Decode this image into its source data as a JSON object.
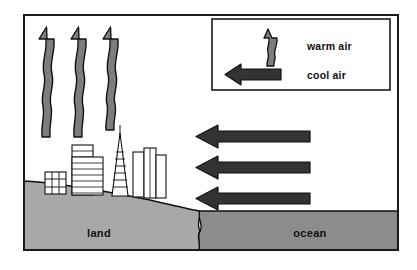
{
  "figure": {
    "frame": {
      "border_color": "#1a1a1a",
      "background": "#ffffff"
    }
  },
  "colors": {
    "warm_arrow_fill": "#7d7d7d",
    "warm_arrow_stroke": "#111111",
    "cool_arrow_fill": "#333333",
    "cool_arrow_stroke": "#111111",
    "land_fill": "#a8a8a8",
    "ocean_fill": "#8c8c8c",
    "building_fill": "#ffffff",
    "building_stroke": "#111111",
    "text_color": "#101010",
    "frame_stroke": "#1a1a1a"
  },
  "legend": {
    "name": "air-movement-legend",
    "items": [
      {
        "icon": "wavy-up-arrow-icon",
        "label": "warm air"
      },
      {
        "icon": "straight-left-arrow-icon",
        "label": "cool air"
      }
    ]
  },
  "terrain": {
    "land": {
      "label": "land"
    },
    "ocean": {
      "label": "ocean"
    }
  },
  "warm_air_arrows": {
    "name": "warm-air-arrow-group",
    "count": 3,
    "direction": "up",
    "style": "wavy",
    "positions": [
      {
        "x": 47,
        "y": 36
      },
      {
        "x": 79,
        "y": 36
      },
      {
        "x": 111,
        "y": 36
      }
    ]
  },
  "cool_air_arrows": {
    "name": "cool-air-arrow-group",
    "count": 3,
    "direction": "left",
    "style": "straight",
    "positions": [
      {
        "y": 136,
        "x_tail": 310,
        "x_head": 196
      },
      {
        "y": 167,
        "x_tail": 310,
        "x_head": 196
      },
      {
        "y": 198,
        "x_tail": 310,
        "x_head": 196
      }
    ]
  },
  "skyline": {
    "name": "city-skyline",
    "buildings": [
      {
        "type": "low-grid-building",
        "x": 45,
        "y": 172,
        "width": 20,
        "height": 22
      },
      {
        "type": "striped-tower",
        "x": 72,
        "y": 145,
        "width": 20,
        "height": 49
      },
      {
        "type": "striped-tower-wide",
        "x": 72,
        "y": 157,
        "width": 30,
        "height": 37
      },
      {
        "type": "pyramid-tower-with-spire",
        "x": 112,
        "y": 133,
        "width": 16,
        "height": 62
      },
      {
        "type": "rect-tower",
        "x": 133,
        "y": 152,
        "width": 10,
        "height": 44
      },
      {
        "type": "rect-tower",
        "x": 144,
        "y": 148,
        "width": 11,
        "height": 48
      },
      {
        "type": "rect-tower",
        "x": 155,
        "y": 155,
        "width": 9,
        "height": 41
      }
    ]
  }
}
